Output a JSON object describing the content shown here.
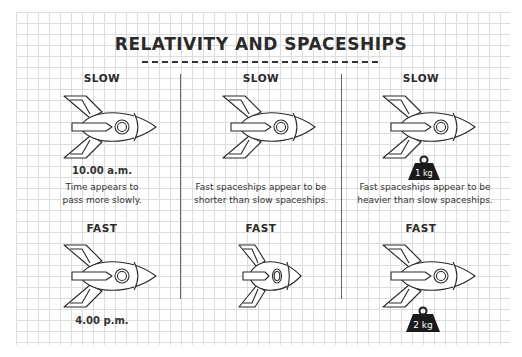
{
  "title": "RELATIVITY AND SPACESHIPS",
  "columns": [
    {
      "top_label": "SLOW",
      "top_note": "10.00 a.m.",
      "caption_line1": "Time appears to",
      "caption_line2": "pass more slowly.",
      "bottom_label": "FAST",
      "bottom_note": "4.00 p.m."
    },
    {
      "top_label": "SLOW",
      "caption_line1": "Fast spaceships appear to be",
      "caption_line2": "shorter than slow spaceships.",
      "bottom_label": "FAST"
    },
    {
      "top_label": "SLOW",
      "top_weight": "1 kg",
      "caption_line1": "Fast spaceships appear to be",
      "caption_line2": "heavier than slow spaceships.",
      "bottom_label": "FAST",
      "bottom_weight": "2 kg"
    }
  ],
  "colors": {
    "line": "#2a2a2a",
    "grid": "#dcdcdc",
    "weight": "#1a1a1a"
  }
}
